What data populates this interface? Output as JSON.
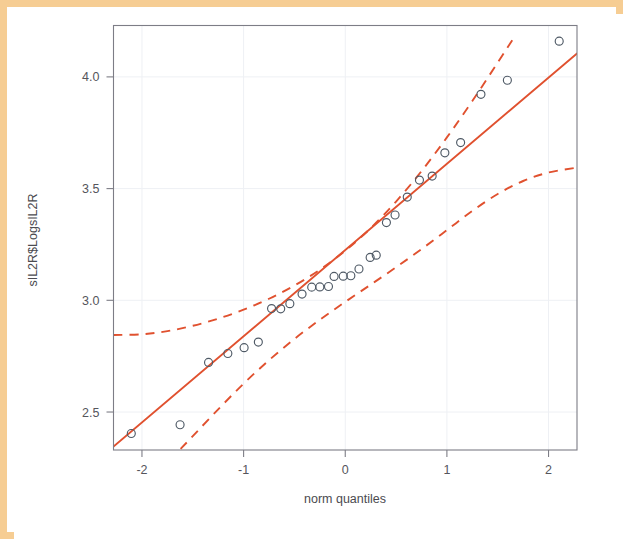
{
  "figure": {
    "kind": "normal-qq-plot",
    "background_color": "#ffffff",
    "frame_color": "#f6cd93",
    "panel_border_color": "#7d7d86",
    "grid_color": "#eef0f4"
  },
  "chart_data": {
    "type": "scatter",
    "title": "",
    "subtitle": "",
    "xlabel": "norm quantiles",
    "ylabel": "sIL2R$LogsIL2R",
    "xlim": [
      -2.28,
      2.28
    ],
    "ylim": [
      2.33,
      4.23
    ],
    "xticks": [
      -2,
      -1,
      0,
      1,
      2
    ],
    "xtick_labels": [
      "-2",
      "-1",
      "0",
      "1",
      "2"
    ],
    "yticks": [
      2.5,
      3.0,
      3.5,
      4.0
    ],
    "ytick_labels": [
      "2.5",
      "3.0",
      "3.5",
      "4.0"
    ],
    "grid": true,
    "legend": "none",
    "marker": {
      "shape": "open-circle",
      "radius_px": 4.0,
      "color": "#4f5a66",
      "fill": "none"
    },
    "reference_line": {
      "name": "qq reference line (robust quartile fit)",
      "style": "solid",
      "color": "#e0512f",
      "x": [
        -2.28,
        2.28
      ],
      "y": [
        2.345,
        4.105
      ]
    },
    "confidence_envelope": {
      "name": "pointwise 95% confidence envelope",
      "style": "dashed",
      "color": "#e0512f",
      "upper": {
        "x": [
          -2.28,
          -2.0,
          -1.75,
          -1.5,
          -1.25,
          -1.0,
          -0.75,
          -0.5,
          -0.25,
          0.0,
          0.25,
          0.5,
          0.75,
          1.0,
          1.25,
          1.5,
          1.68
        ],
        "y": [
          2.845,
          2.848,
          2.862,
          2.886,
          2.918,
          2.958,
          3.007,
          3.066,
          3.137,
          3.222,
          3.323,
          3.442,
          3.578,
          3.729,
          3.892,
          4.064,
          4.19
        ]
      },
      "lower": {
        "x": [
          -1.62,
          -1.5,
          -1.25,
          -1.0,
          -0.75,
          -0.5,
          -0.25,
          0.0,
          0.25,
          0.5,
          0.75,
          1.0,
          1.25,
          1.5,
          1.75,
          2.0,
          2.28
        ],
        "y": [
          2.335,
          2.392,
          2.512,
          2.627,
          2.732,
          2.827,
          2.913,
          2.993,
          3.07,
          3.148,
          3.229,
          3.314,
          3.4,
          3.476,
          3.534,
          3.572,
          3.594
        ]
      }
    },
    "n_points": 28,
    "points": [
      {
        "x": -2.105,
        "y": 2.404
      },
      {
        "x": -1.625,
        "y": 2.443
      },
      {
        "x": -1.345,
        "y": 2.722
      },
      {
        "x": -1.155,
        "y": 2.762
      },
      {
        "x": -0.995,
        "y": 2.788
      },
      {
        "x": -0.855,
        "y": 2.813
      },
      {
        "x": -0.725,
        "y": 2.963
      },
      {
        "x": -0.635,
        "y": 2.962
      },
      {
        "x": -0.545,
        "y": 2.985
      },
      {
        "x": -0.425,
        "y": 3.028
      },
      {
        "x": -0.33,
        "y": 3.059
      },
      {
        "x": -0.25,
        "y": 3.06
      },
      {
        "x": -0.165,
        "y": 3.062
      },
      {
        "x": -0.11,
        "y": 3.107
      },
      {
        "x": -0.02,
        "y": 3.108
      },
      {
        "x": 0.055,
        "y": 3.11
      },
      {
        "x": 0.135,
        "y": 3.14
      },
      {
        "x": 0.245,
        "y": 3.192
      },
      {
        "x": 0.305,
        "y": 3.202
      },
      {
        "x": 0.405,
        "y": 3.348
      },
      {
        "x": 0.49,
        "y": 3.382
      },
      {
        "x": 0.61,
        "y": 3.462
      },
      {
        "x": 0.73,
        "y": 3.538
      },
      {
        "x": 0.855,
        "y": 3.556
      },
      {
        "x": 0.98,
        "y": 3.66
      },
      {
        "x": 1.135,
        "y": 3.706
      },
      {
        "x": 1.335,
        "y": 3.922
      },
      {
        "x": 1.595,
        "y": 3.985
      },
      {
        "x": 2.105,
        "y": 4.16
      }
    ]
  }
}
